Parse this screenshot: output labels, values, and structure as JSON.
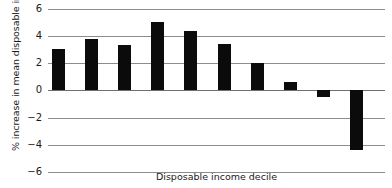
{
  "chart_data": {
    "type": "bar",
    "title": "",
    "xlabel": "Disposable income decile",
    "ylabel": "% increase in mean disposable income",
    "categories": [
      "1",
      "2",
      "3",
      "4",
      "5",
      "6",
      "7",
      "8",
      "9",
      "10"
    ],
    "values": [
      3.0,
      3.7,
      3.3,
      5.0,
      4.3,
      3.4,
      2.0,
      0.6,
      -0.5,
      -4.4
    ],
    "ylim": [
      -6,
      6
    ],
    "yticks": [
      6,
      4,
      2,
      0,
      -2,
      -4,
      -6
    ],
    "ytick_labels": [
      "6",
      "4",
      "2",
      "0",
      "−2",
      "−4",
      "−6"
    ],
    "xtick_labels": [],
    "grid": true,
    "legend": false,
    "bar_color": "#0b0b0b",
    "grid_color": "#8d8d8d"
  }
}
